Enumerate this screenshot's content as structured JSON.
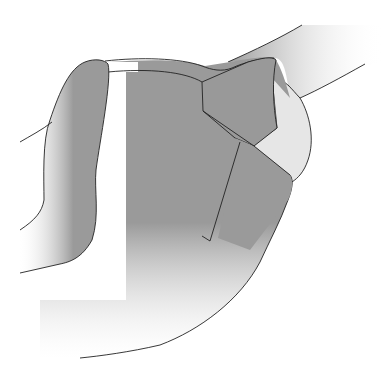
{
  "figure": {
    "type": "vector-illustration",
    "colors": {
      "background": "#ffffff",
      "main_fill": "#9a9a9a",
      "light_fill": "#e6e6e6",
      "outline": "#222222"
    }
  }
}
